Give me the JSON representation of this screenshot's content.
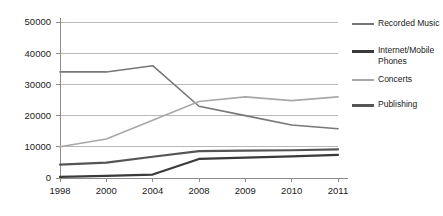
{
  "chart_data": {
    "type": "line",
    "title": "",
    "subtitle": "",
    "xlabel": "",
    "ylabel": "",
    "categories": [
      "1998",
      "2000",
      "2004",
      "2008",
      "2009",
      "2010",
      "2011"
    ],
    "ylim": [
      0,
      50000
    ],
    "ytick_labels": [
      "0",
      "10000",
      "20000",
      "30000",
      "40000",
      "50000"
    ],
    "ytick_values": [
      0,
      10000,
      20000,
      30000,
      40000,
      50000
    ],
    "grid": true,
    "legend_position": "right",
    "series": [
      {
        "name": "Recorded Music",
        "color": "#777777",
        "width": 1.6,
        "values": [
          34000,
          34000,
          36000,
          23000,
          20000,
          17000,
          15800
        ]
      },
      {
        "name": "Internet/Mobile\nPhones",
        "color": "#3a3a3a",
        "width": 2.2,
        "values": [
          350,
          700,
          1100,
          6100,
          6500,
          6900,
          7400
        ]
      },
      {
        "name": "Concerts",
        "color": "#a8a8a8",
        "width": 1.6,
        "values": [
          10000,
          12500,
          18500,
          24500,
          26000,
          24800,
          26000
        ]
      },
      {
        "name": "Publishing",
        "color": "#555555",
        "width": 2.2,
        "values": [
          4300,
          4900,
          6800,
          8600,
          8800,
          8900,
          9200
        ]
      }
    ]
  },
  "legend": {
    "items": [
      {
        "label": "Recorded Music",
        "color": "#777777"
      },
      {
        "label": "Internet/Mobile\nPhones",
        "color": "#3a3a3a"
      },
      {
        "label": "Concerts",
        "color": "#a8a8a8"
      },
      {
        "label": "Publishing",
        "color": "#555555"
      }
    ]
  },
  "colors": {
    "background": "#ffffff",
    "grid": "#b0b0b0",
    "axis": "#8c8c8c",
    "text": "#1a1a1a"
  }
}
